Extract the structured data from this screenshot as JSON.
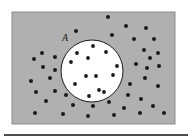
{
  "figure": {
    "caption_label": "A",
    "background_color": "#ffffff",
    "region_fill": "#b0b0b0",
    "region_stroke": "#8c8c8c",
    "circle_fill": "#ffffff",
    "circle_stroke": "#1a1a1a",
    "dot_color": "#1a1a1a",
    "rule_color": "#4d4d4d",
    "outer_rect": {
      "x": 12,
      "y": 12,
      "width": 163,
      "height": 112
    },
    "circle": {
      "cx": 92,
      "cy": 71,
      "r": 31
    },
    "label_position": {
      "x": 62,
      "y": 41
    },
    "bottom_rule": {
      "x": 4,
      "y": 134,
      "width": 184,
      "height": 2
    },
    "dot_radius_outside": 2.0,
    "dot_radius_inside": 1.9,
    "dots_inside_circle": [
      {
        "x": 93,
        "y": 46
      },
      {
        "x": 106,
        "y": 52
      },
      {
        "x": 77,
        "y": 53
      },
      {
        "x": 88,
        "y": 58
      },
      {
        "x": 71,
        "y": 62
      },
      {
        "x": 117,
        "y": 66
      },
      {
        "x": 86,
        "y": 76
      },
      {
        "x": 96,
        "y": 76
      },
      {
        "x": 113,
        "y": 75
      },
      {
        "x": 75,
        "y": 84
      },
      {
        "x": 99,
        "y": 90
      },
      {
        "x": 104,
        "y": 92
      },
      {
        "x": 89,
        "y": 96
      }
    ],
    "dots_outside_circle": [
      {
        "x": 108,
        "y": 17
      },
      {
        "x": 76,
        "y": 31
      },
      {
        "x": 126,
        "y": 26
      },
      {
        "x": 146,
        "y": 28
      },
      {
        "x": 112,
        "y": 35
      },
      {
        "x": 134,
        "y": 39
      },
      {
        "x": 154,
        "y": 39
      },
      {
        "x": 42,
        "y": 53
      },
      {
        "x": 34,
        "y": 59
      },
      {
        "x": 55,
        "y": 57
      },
      {
        "x": 144,
        "y": 50
      },
      {
        "x": 158,
        "y": 53
      },
      {
        "x": 150,
        "y": 58
      },
      {
        "x": 43,
        "y": 67
      },
      {
        "x": 55,
        "y": 70
      },
      {
        "x": 136,
        "y": 64
      },
      {
        "x": 147,
        "y": 68
      },
      {
        "x": 159,
        "y": 66
      },
      {
        "x": 31,
        "y": 81
      },
      {
        "x": 50,
        "y": 78
      },
      {
        "x": 145,
        "y": 78
      },
      {
        "x": 130,
        "y": 84
      },
      {
        "x": 158,
        "y": 86
      },
      {
        "x": 36,
        "y": 92
      },
      {
        "x": 55,
        "y": 91
      },
      {
        "x": 66,
        "y": 95
      },
      {
        "x": 128,
        "y": 95
      },
      {
        "x": 141,
        "y": 99
      },
      {
        "x": 46,
        "y": 101
      },
      {
        "x": 73,
        "y": 105
      },
      {
        "x": 93,
        "y": 106
      },
      {
        "x": 109,
        "y": 102
      },
      {
        "x": 124,
        "y": 108
      },
      {
        "x": 153,
        "y": 106
      },
      {
        "x": 35,
        "y": 113
      },
      {
        "x": 63,
        "y": 114
      },
      {
        "x": 88,
        "y": 116
      },
      {
        "x": 114,
        "y": 115
      },
      {
        "x": 140,
        "y": 113
      },
      {
        "x": 164,
        "y": 113
      }
    ]
  }
}
